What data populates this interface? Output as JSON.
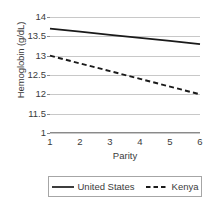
{
  "chart_data": {
    "type": "line",
    "title": "",
    "xlabel": "Parity",
    "ylabel": "Hemoglobin (g/dL)",
    "x": [
      1,
      2,
      3,
      4,
      5,
      6
    ],
    "xtick_labels": [
      "1",
      "2",
      "3",
      "4",
      "5",
      "6"
    ],
    "ytick_labels": [
      "14",
      "13.5",
      "13",
      "12.5",
      "12",
      "11.5",
      "1"
    ],
    "ytick_values": [
      14,
      13.5,
      13,
      12.5,
      12,
      11.5,
      11
    ],
    "xlim": [
      1,
      6
    ],
    "ylim": [
      11,
      14
    ],
    "grid": "horizontal",
    "legend_position": "bottom",
    "series": [
      {
        "name": "United States",
        "style": "solid",
        "color": "#1a1a1a",
        "values": [
          13.7,
          13.62,
          13.54,
          13.46,
          13.38,
          13.3
        ]
      },
      {
        "name": "Kenya",
        "style": "dashed",
        "color": "#1a1a1a",
        "values": [
          13.0,
          12.8,
          12.6,
          12.4,
          12.2,
          12.0
        ]
      }
    ]
  },
  "colors": {
    "gridline": "#c8c8c8",
    "axis": "#8a8a8a",
    "text": "#3b3b3b",
    "series": "#1a1a1a",
    "legend_border": "#a6a6a6",
    "background": "#ffffff"
  }
}
